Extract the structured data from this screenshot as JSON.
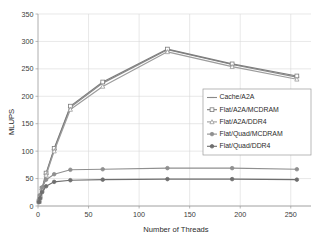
{
  "chart_data": {
    "type": "line",
    "title": "",
    "xlabel": "Number of Threads",
    "ylabel": "MLUPS",
    "xlim": [
      0,
      270
    ],
    "ylim": [
      0,
      350
    ],
    "xticks": [
      0,
      50,
      100,
      150,
      200,
      250
    ],
    "yticks": [
      0,
      50,
      100,
      150,
      200,
      250,
      300,
      350
    ],
    "grid": true,
    "legend_position": "center-right",
    "x": [
      1,
      2,
      4,
      8,
      16,
      32,
      64,
      128,
      192,
      256
    ],
    "series": [
      {
        "name": "Cache/A2A",
        "color": "#8a8a8a",
        "marker": "dash-cross",
        "values": [
          8,
          16,
          30,
          58,
          103,
          180,
          224,
          285,
          258,
          235
        ]
      },
      {
        "name": "Flat/A2A/MCDRAM",
        "color": "#7d7d7d",
        "marker": "square",
        "values": [
          9,
          17,
          32,
          60,
          105,
          182,
          226,
          286,
          259,
          237
        ]
      },
      {
        "name": "Flat/A2A/DDR4",
        "color": "#9c9c9c",
        "marker": "triangle",
        "values": [
          8,
          15,
          29,
          56,
          100,
          176,
          218,
          281,
          254,
          231
        ]
      },
      {
        "name": "Flat/Quad/MCDRAM",
        "color": "#8f8f8f",
        "marker": "circle",
        "values": [
          10,
          20,
          34,
          48,
          58,
          66,
          67,
          69,
          69,
          67
        ]
      },
      {
        "name": "Flat/Quad/DDR4",
        "color": "#6e6e6e",
        "marker": "circle",
        "values": [
          7,
          14,
          25,
          36,
          44,
          47,
          48,
          49,
          49,
          48
        ]
      }
    ]
  },
  "axes": {
    "y_title": "MLUPS",
    "x_title": "Number of Threads",
    "y_tick_labels": [
      "0",
      "50",
      "100",
      "150",
      "200",
      "250",
      "300",
      "350"
    ],
    "x_tick_labels": [
      "0",
      "50",
      "100",
      "150",
      "200",
      "250"
    ]
  },
  "legend": {
    "entries": [
      "Cache/A2A",
      "Flat/A2A/MCDRAM",
      "Flat/A2A/DDR4",
      "Flat/Quad/MCDRAM",
      "Flat/Quad/DDR4"
    ]
  }
}
